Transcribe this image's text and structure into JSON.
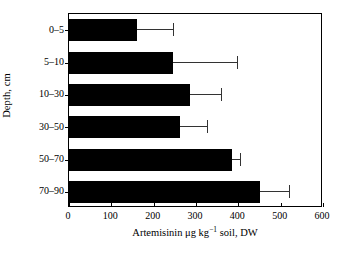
{
  "chart_data": {
    "type": "bar",
    "orientation": "horizontal",
    "title": "",
    "xlabel": "Artemisinin μg kg⁻¹ soil, DW",
    "xlabel_parts": {
      "main": "Artemisinin μg kg",
      "sup": "−1",
      "tail": " soil, DW"
    },
    "ylabel": "Depth, cm",
    "categories": [
      "0–5",
      "5–10",
      "10–30",
      "30–50",
      "50–70",
      "70–90"
    ],
    "values": [
      160,
      245,
      287,
      263,
      386,
      450
    ],
    "error_upper": [
      245,
      397,
      360,
      325,
      405,
      520
    ],
    "xlim": [
      0,
      600
    ],
    "xticks": [
      0,
      100,
      200,
      300,
      400,
      500,
      600
    ],
    "xticklabels": [
      "0",
      "100",
      "200",
      "300",
      "400",
      "500",
      "600"
    ],
    "grid": false,
    "legend": null,
    "bar_color": "#000000",
    "error_color": "#333333",
    "frame_color": "#000000",
    "background": "#ffffff"
  }
}
